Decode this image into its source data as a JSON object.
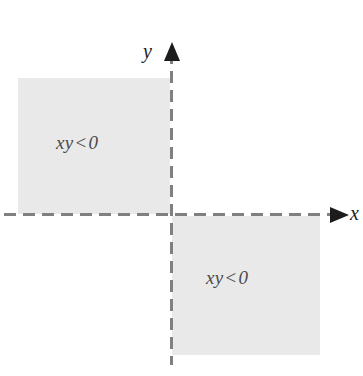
{
  "figure": {
    "width": 363,
    "height": 376,
    "background_color": "#ffffff"
  },
  "axes": {
    "style": "dashed",
    "color": "#808080",
    "arrow_color": "#1c1c1c",
    "origin": {
      "x": 171,
      "y": 215
    },
    "x_axis": {
      "label": "x",
      "arrow_direction": "right"
    },
    "y_axis": {
      "label": "y",
      "arrow_direction": "up"
    }
  },
  "regions": [
    {
      "name": "quadrant-II",
      "label": "xy",
      "operator": "<",
      "value": "0",
      "fill_color": "#e9e9e9",
      "text_color": "#4a4a4a"
    },
    {
      "name": "quadrant-IV",
      "label": "xy",
      "operator": "<",
      "value": "0",
      "fill_color": "#e9e9e9",
      "text_color": "#4a4a4a"
    }
  ],
  "chart_data": {
    "type": "scatter",
    "xlabel": "x",
    "ylabel": "y",
    "xlim": [
      -1.15,
      1.35
    ],
    "ylim": [
      -1.2,
      1.3
    ],
    "grid": false,
    "legend": null,
    "annotations": [
      {
        "text": "xy < 0",
        "quadrant": "II",
        "x": -0.55,
        "y": 0.55
      },
      {
        "text": "xy < 0",
        "quadrant": "IV",
        "x": 0.55,
        "y": -0.5
      }
    ],
    "shaded_regions": [
      {
        "quadrant": "II",
        "x_range": [
          -1.0,
          0.0
        ],
        "y_range": [
          0.0,
          1.0
        ],
        "condition": "xy < 0",
        "color": "#e9e9e9"
      },
      {
        "quadrant": "IV",
        "x_range": [
          0.0,
          1.0
        ],
        "y_range": [
          -1.0,
          0.0
        ],
        "condition": "xy < 0",
        "color": "#e9e9e9"
      }
    ]
  }
}
